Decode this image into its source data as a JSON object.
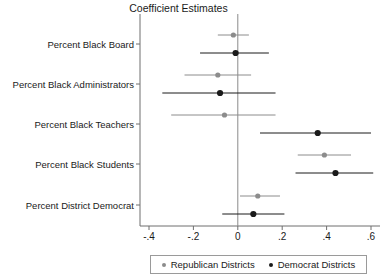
{
  "chart": {
    "title": "Coefficient Estimates",
    "xlabel": "",
    "ylabel": ""
  },
  "legend": {
    "position": "bottom",
    "entries": [
      {
        "label": "Republican Districts",
        "color": "#8c8c8c",
        "marker": "circle"
      },
      {
        "label": "Democrat Districts",
        "color": "#1a1a1a",
        "marker": "circle"
      }
    ]
  },
  "axis": {
    "x_ticks": [
      "-.4",
      "-.2",
      "0",
      ".2",
      ".4",
      ".6"
    ],
    "x_tick_values": [
      -0.4,
      -0.2,
      0,
      0.2,
      0.4,
      0.6
    ],
    "zero_line": "0"
  },
  "chart_data": {
    "type": "scatter",
    "title": "Coefficient Estimates",
    "xlabel": "",
    "ylabel": "",
    "xlim": [
      -0.44,
      0.62
    ],
    "ylim": [
      0,
      5
    ],
    "grid": false,
    "legend_position": "bottom",
    "x_ticks": [
      -0.4,
      -0.2,
      0,
      0.2,
      0.4,
      0.6
    ],
    "x_tick_labels": [
      "-.4",
      "-.2",
      "0",
      ".2",
      ".4",
      ".6"
    ],
    "categories": [
      "Percent Black Board",
      "Percent Black Administrators",
      "Percent Black Teachers",
      "Percent Black Students",
      "Percent District Democrat"
    ],
    "reference_line_x": 0,
    "series": [
      {
        "name": "Republican Districts",
        "color": "#8c8c8c",
        "values": [
          -0.02,
          -0.09,
          -0.06,
          0.39,
          0.09
        ],
        "ci_low": [
          -0.09,
          -0.24,
          -0.3,
          0.27,
          0.01
        ],
        "ci_high": [
          0.05,
          0.06,
          0.17,
          0.51,
          0.19
        ]
      },
      {
        "name": "Democrat Districts",
        "color": "#1a1a1a",
        "values": [
          -0.01,
          -0.08,
          0.36,
          0.44,
          0.07
        ],
        "ci_low": [
          -0.17,
          -0.34,
          0.1,
          0.26,
          -0.07
        ],
        "ci_high": [
          0.14,
          0.17,
          0.6,
          0.61,
          0.21
        ]
      }
    ]
  }
}
